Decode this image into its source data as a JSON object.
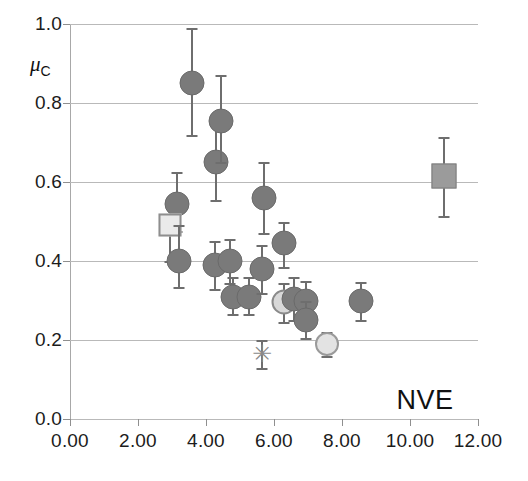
{
  "figure": {
    "corner_label": "NVE",
    "ylabel_symbol": "μ",
    "ylabel_subscript": "C"
  },
  "axes": {
    "y_ticks": [
      "0.0",
      "0.2",
      "0.4",
      "0.6",
      "0.8",
      "1.0"
    ],
    "x_ticks": [
      "0.00",
      "2.00",
      "4.00",
      "6.00",
      "8.00",
      "10.00",
      "12.00"
    ]
  },
  "colors": {
    "marker_dark": "#7a7a7a",
    "marker_light": "#e3e3e3",
    "errorbar": "#6e6e6e",
    "gridline": "#b9b9b9",
    "text": "#1c1c1c"
  },
  "chart_data": {
    "type": "scatter",
    "title": "",
    "xlabel": "NVE",
    "ylabel": "μ_C",
    "xlim": [
      0.0,
      12.0
    ],
    "ylim": [
      0.0,
      1.0
    ],
    "xticks": [
      0.0,
      2.0,
      4.0,
      6.0,
      8.0,
      10.0,
      12.0
    ],
    "yticks": [
      0.0,
      0.2,
      0.4,
      0.6,
      0.8,
      1.0
    ],
    "grid": "horizontal",
    "legend": "none",
    "points": [
      {
        "x": 3.15,
        "y": 0.545,
        "yerr_low": 0.475,
        "yerr_high": 0.625,
        "marker": "circle-dark"
      },
      {
        "x": 2.95,
        "y": 0.49,
        "yerr_low": 0.4,
        "yerr_high": 0.49,
        "marker": "square-light"
      },
      {
        "x": 3.2,
        "y": 0.4,
        "yerr_low": 0.335,
        "yerr_high": 0.49,
        "marker": "circle-dark"
      },
      {
        "x": 3.6,
        "y": 0.85,
        "yerr_low": 0.72,
        "yerr_high": 0.99,
        "marker": "circle-dark"
      },
      {
        "x": 4.3,
        "y": 0.65,
        "yerr_low": 0.555,
        "yerr_high": 0.76,
        "marker": "circle-dark"
      },
      {
        "x": 4.45,
        "y": 0.755,
        "yerr_low": 0.65,
        "yerr_high": 0.87,
        "marker": "circle-dark"
      },
      {
        "x": 4.25,
        "y": 0.39,
        "yerr_low": 0.33,
        "yerr_high": 0.45,
        "marker": "circle-dark"
      },
      {
        "x": 4.7,
        "y": 0.4,
        "yerr_low": 0.345,
        "yerr_high": 0.455,
        "marker": "circle-dark"
      },
      {
        "x": 4.8,
        "y": 0.31,
        "yerr_low": 0.265,
        "yerr_high": 0.36,
        "marker": "circle-dark"
      },
      {
        "x": 5.25,
        "y": 0.31,
        "yerr_low": 0.265,
        "yerr_high": 0.36,
        "marker": "circle-dark"
      },
      {
        "x": 5.7,
        "y": 0.56,
        "yerr_low": 0.47,
        "yerr_high": 0.65,
        "marker": "circle-dark"
      },
      {
        "x": 5.65,
        "y": 0.38,
        "yerr_low": 0.32,
        "yerr_high": 0.44,
        "marker": "circle-dark"
      },
      {
        "x": 5.65,
        "y": 0.165,
        "yerr_low": 0.13,
        "yerr_high": 0.2,
        "marker": "star"
      },
      {
        "x": 6.3,
        "y": 0.445,
        "yerr_low": 0.385,
        "yerr_high": 0.5,
        "marker": "circle-dark"
      },
      {
        "x": 6.3,
        "y": 0.295,
        "yerr_low": 0.245,
        "yerr_high": 0.345,
        "marker": "circle-mid"
      },
      {
        "x": 6.6,
        "y": 0.305,
        "yerr_low": 0.25,
        "yerr_high": 0.36,
        "marker": "circle-dark"
      },
      {
        "x": 6.95,
        "y": 0.3,
        "yerr_low": 0.255,
        "yerr_high": 0.35,
        "marker": "circle-dark"
      },
      {
        "x": 6.95,
        "y": 0.25,
        "yerr_low": 0.205,
        "yerr_high": 0.3,
        "marker": "circle-dark"
      },
      {
        "x": 7.55,
        "y": 0.19,
        "yerr_low": 0.16,
        "yerr_high": 0.22,
        "marker": "circle-light"
      },
      {
        "x": 8.55,
        "y": 0.298,
        "yerr_low": 0.25,
        "yerr_high": 0.348,
        "marker": "circle-dark"
      },
      {
        "x": 11.0,
        "y": 0.615,
        "yerr_low": 0.515,
        "yerr_high": 0.715,
        "marker": "square-dark"
      }
    ]
  }
}
